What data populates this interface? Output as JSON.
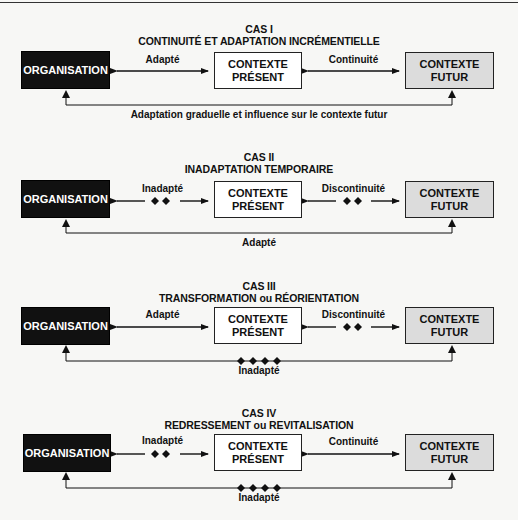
{
  "colors": {
    "organisation_fill": "#111111",
    "present_fill": "#ffffff",
    "futur_fill": "#dcdcdc",
    "line": "#111111",
    "background": "#f7f7f5"
  },
  "boxes": {
    "organisation": "ORGANISATION",
    "present_line1": "CONTEXTE",
    "present_line2": "PRÉSENT",
    "futur_line1": "CONTEXTE",
    "futur_line2": "FUTUR"
  },
  "cases": [
    {
      "title": "CAS I",
      "subtitle": "CONTINUITÉ ET ADAPTATION INCRÉMENTIELLE",
      "left_link": {
        "label": "Adapté",
        "style": "solid",
        "diamonds": 0
      },
      "right_link": {
        "label": "Continuité",
        "style": "solid",
        "diamonds": 0
      },
      "feedback": {
        "label": "Adaptation graduelle et influence sur le contexte futur",
        "diamonds": 0
      }
    },
    {
      "title": "CAS II",
      "subtitle": "INADAPTATION TEMPORAIRE",
      "left_link": {
        "label": "Inadapté",
        "style": "broken",
        "diamonds": 2
      },
      "right_link": {
        "label": "Discontinuité",
        "style": "broken",
        "diamonds": 2
      },
      "feedback": {
        "label": "Adapté",
        "diamonds": 0
      }
    },
    {
      "title": "CAS III",
      "subtitle": "TRANSFORMATION ou RÉORIENTATION",
      "left_link": {
        "label": "Adapté",
        "style": "solid",
        "diamonds": 0
      },
      "right_link": {
        "label": "Discontinuité",
        "style": "broken",
        "diamonds": 2
      },
      "feedback": {
        "label": "Inadapté",
        "diamonds": 4
      }
    },
    {
      "title": "CAS IV",
      "subtitle": "REDRESSEMENT ou REVITALISATION",
      "left_link": {
        "label": "Inadapté",
        "style": "broken",
        "diamonds": 2
      },
      "right_link": {
        "label": "Continuité",
        "style": "solid",
        "diamonds": 0
      },
      "feedback": {
        "label": "Inadapté",
        "diamonds": 4
      }
    }
  ]
}
